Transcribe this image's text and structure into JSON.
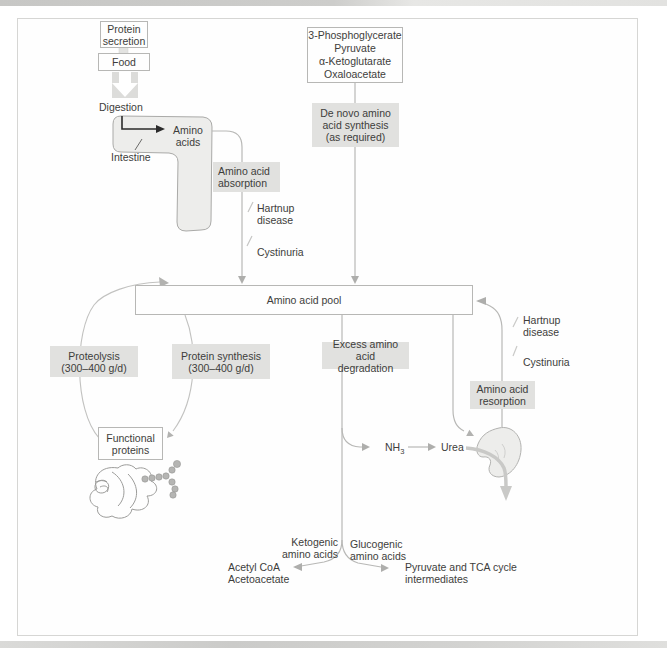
{
  "palette": {
    "chip_bg": "#e1e1df",
    "line_grey": "#b8b8b6",
    "arrow_black": "#2b2b2b",
    "organ_fill": "#ededeb",
    "text": "#3d3d3b"
  },
  "boxes": {
    "protein_secretion": {
      "lines": [
        "Protein",
        "secretion"
      ]
    },
    "food": {
      "label": "Food"
    },
    "precursors": {
      "lines": [
        "3-Phosphoglycerate",
        "Pyruvate",
        "α-Ketoglutarate",
        "Oxaloacetate"
      ]
    },
    "amino_acid_pool": {
      "label": "Amino acid pool"
    },
    "functional_proteins": {
      "lines": [
        "Functional",
        "proteins"
      ]
    }
  },
  "chips": {
    "amino_acid_absorption": {
      "lines": [
        "Amino acid",
        "absorption"
      ]
    },
    "de_novo_synthesis": {
      "lines": [
        "De novo amino",
        "acid synthesis",
        "(as required)"
      ]
    },
    "proteolysis": {
      "lines": [
        "Proteolysis",
        "(300–400 g/d)"
      ]
    },
    "protein_synthesis": {
      "lines": [
        "Protein synthesis",
        "(300–400 g/d)"
      ]
    },
    "excess_degradation": {
      "lines": [
        "Excess amino acid",
        "degradation"
      ]
    },
    "amino_acid_resorption": {
      "lines": [
        "Amino acid",
        "resorption"
      ]
    }
  },
  "labels": {
    "digestion": "Digestion",
    "amino_acids": {
      "lines": [
        "Amino",
        "acids"
      ]
    },
    "intestine": "Intestine",
    "hartnup_left": {
      "lines": [
        "Hartnup",
        "disease"
      ]
    },
    "cystinuria_left": "Cystinuria",
    "hartnup_right": {
      "lines": [
        "Hartnup",
        "disease"
      ]
    },
    "cystinuria_right": "Cystinuria",
    "nh3": {
      "base": "NH",
      "sub": "3"
    },
    "urea": "Urea",
    "ketogenic": {
      "lines": [
        "Ketogenic",
        "amino acids"
      ]
    },
    "glucogenic": {
      "lines": [
        "Glucogenic",
        "amino acids"
      ]
    },
    "acetyl": {
      "lines": [
        "Acetyl CoA",
        "Acetoacetate"
      ]
    },
    "pyruvate_tca": {
      "lines": [
        "Pyruvate and TCA cycle",
        "intermediates"
      ]
    }
  }
}
